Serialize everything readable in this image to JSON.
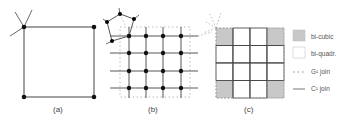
{
  "panels": [
    {
      "id": "a",
      "label": "(a)"
    },
    {
      "id": "b",
      "label": "(b)"
    },
    {
      "id": "c",
      "label": "(c)"
    }
  ],
  "legend": [
    {
      "key": "bi-cubic",
      "label": "bi-cubic",
      "swatch": "gray-fill"
    },
    {
      "key": "bi-quadr",
      "label": "bi-quadr.",
      "swatch": "white-fill"
    },
    {
      "key": "g1-join",
      "label": "G¹ join",
      "swatch": "dotted-line"
    },
    {
      "key": "c1-join",
      "label": "C¹ join",
      "swatch": "solid-line"
    }
  ],
  "colors": {
    "line": "#333333",
    "node": "#111111",
    "dotted": "#999999",
    "bicubic_fill": "#c8c8c8"
  }
}
